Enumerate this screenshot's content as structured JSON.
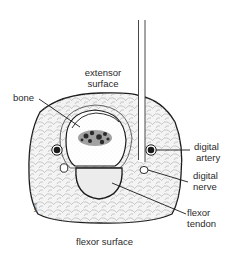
{
  "diagram": {
    "labels": {
      "extensor_surface_line1": "extensor",
      "extensor_surface_line2": "surface",
      "bone": "bone",
      "digital_artery_line1": "digital",
      "digital_artery_line2": "artery",
      "digital_nerve_line1": "digital",
      "digital_nerve_line2": "nerve",
      "flexor_tendon_line1": "flexor",
      "flexor_tendon_line2": "tendon",
      "flexor_surface": "flexor surface"
    },
    "signature": "MMS",
    "colors": {
      "line": "#1a1a1a",
      "tissue_fill": "#f3f3f3",
      "bone_fill": "#ffffff",
      "marrow": "#2a2a2a",
      "tendon_fill": "#ececec"
    }
  }
}
